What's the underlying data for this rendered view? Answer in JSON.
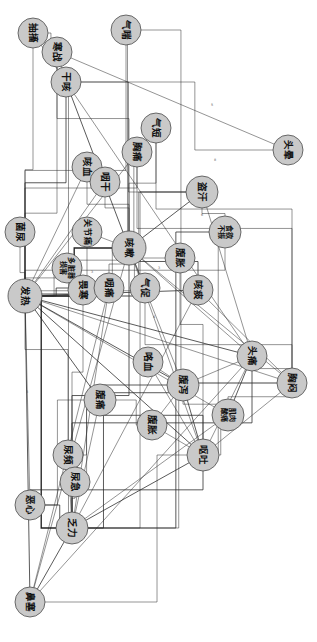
{
  "figure": {
    "type": "network-graph",
    "orientation_deg": 90,
    "node_count": 31,
    "background_color": "#ffffff",
    "node_fill_color": "#c9c9c9",
    "node_stroke_color": "#4a4a4a",
    "edge_color": "#2b2b2b"
  },
  "chart_data": {
    "type": "network",
    "layout": "force-directed",
    "nodes": [
      {
        "id": "chouchu",
        "label": "抽搐",
        "x": 33,
        "y": 33,
        "r": 15,
        "degree": 4
      },
      {
        "id": "hanzhan",
        "label": "寒战",
        "x": 57,
        "y": 52,
        "r": 15,
        "degree": 7
      },
      {
        "id": "gan_ke",
        "label": "干咳",
        "x": 66,
        "y": 82,
        "r": 15,
        "degree": 11
      },
      {
        "id": "qichuan",
        "label": "气喘",
        "x": 126,
        "y": 30,
        "r": 15,
        "degree": 6
      },
      {
        "id": "touyun",
        "label": "头晕",
        "x": 288,
        "y": 150,
        "r": 15,
        "degree": 9
      },
      {
        "id": "qiduan",
        "label": "气短",
        "x": 156,
        "y": 128,
        "r": 15,
        "degree": 8
      },
      {
        "id": "xiongtong",
        "label": "胸痛",
        "x": 137,
        "y": 152,
        "r": 15,
        "degree": 8
      },
      {
        "id": "kexue",
        "label": "咳血",
        "x": 87,
        "y": 167,
        "r": 15,
        "degree": 7
      },
      {
        "id": "yangan",
        "label": "咽干",
        "x": 105,
        "y": 182,
        "r": 15,
        "degree": 7
      },
      {
        "id": "daohan",
        "label": "盗汗",
        "x": 202,
        "y": 192,
        "r": 16,
        "degree": 12
      },
      {
        "id": "junniao",
        "label": "菌尿",
        "x": 20,
        "y": 232,
        "r": 15,
        "degree": 5
      },
      {
        "id": "guanjie",
        "label": "关节痛",
        "x": 87,
        "y": 232,
        "r": 15,
        "degree": 7
      },
      {
        "id": "shiyu",
        "label": "食欲不振",
        "x": 225,
        "y": 232,
        "r": 16,
        "degree": 11
      },
      {
        "id": "duozangqi",
        "label": "多脏器损害",
        "x": 67,
        "y": 268,
        "r": 15,
        "degree": 6
      },
      {
        "id": "kesou",
        "label": "咳嗽",
        "x": 129,
        "y": 248,
        "r": 17,
        "degree": 24
      },
      {
        "id": "fuxie_u",
        "label": "腹胀",
        "x": 180,
        "y": 258,
        "r": 15,
        "degree": 8
      },
      {
        "id": "fare",
        "label": "发热",
        "x": 25,
        "y": 296,
        "r": 17,
        "degree": 26
      },
      {
        "id": "quexie",
        "label": "畏寒",
        "x": 83,
        "y": 290,
        "r": 15,
        "degree": 8
      },
      {
        "id": "yantong",
        "label": "咽痛",
        "x": 109,
        "y": 288,
        "r": 15,
        "degree": 9
      },
      {
        "id": "qicu",
        "label": "气促",
        "x": 145,
        "y": 288,
        "r": 15,
        "degree": 9
      },
      {
        "id": "kuntan",
        "label": "咳痰",
        "x": 198,
        "y": 290,
        "r": 15,
        "degree": 10
      },
      {
        "id": "touteng",
        "label": "头痛",
        "x": 252,
        "y": 356,
        "r": 15,
        "degree": 13
      },
      {
        "id": "xiongmen",
        "label": "胸闷",
        "x": 292,
        "y": 383,
        "r": 15,
        "degree": 12
      },
      {
        "id": "kaxue",
        "label": "咯血",
        "x": 148,
        "y": 362,
        "r": 15,
        "degree": 8
      },
      {
        "id": "fuxie",
        "label": "腹泻",
        "x": 183,
        "y": 385,
        "r": 16,
        "degree": 14
      },
      {
        "id": "jirou",
        "label": "肌肉酸痛",
        "x": 228,
        "y": 415,
        "r": 16,
        "degree": 12
      },
      {
        "id": "futong",
        "label": "腹痛",
        "x": 100,
        "y": 400,
        "r": 16,
        "degree": 13
      },
      {
        "id": "fuzhang",
        "label": "腹胀",
        "x": 152,
        "y": 425,
        "r": 15,
        "degree": 9
      },
      {
        "id": "outu",
        "label": "呕吐",
        "x": 203,
        "y": 455,
        "r": 16,
        "degree": 13
      },
      {
        "id": "niaopin",
        "label": "尿频",
        "x": 68,
        "y": 455,
        "r": 15,
        "degree": 8
      },
      {
        "id": "niaoji",
        "label": "尿急",
        "x": 75,
        "y": 482,
        "r": 15,
        "degree": 7
      },
      {
        "id": "exin",
        "label": "恶心",
        "x": 30,
        "y": 505,
        "r": 15,
        "degree": 7
      },
      {
        "id": "fali",
        "label": "乏力",
        "x": 72,
        "y": 528,
        "r": 16,
        "degree": 15
      },
      {
        "id": "bise",
        "label": "鼻塞",
        "x": 30,
        "y": 602,
        "r": 15,
        "degree": 11
      }
    ],
    "edges": [
      {
        "source": "chouchu",
        "target": "hanzhan",
        "weight": 1
      },
      {
        "source": "chouchu",
        "target": "gan_ke",
        "weight": 1
      },
      {
        "source": "chouchu",
        "target": "fare",
        "weight": 2
      },
      {
        "source": "hanzhan",
        "target": "gan_ke",
        "weight": 1
      },
      {
        "source": "hanzhan",
        "target": "fare",
        "weight": 2
      },
      {
        "source": "hanzhan",
        "target": "kesou",
        "weight": 2
      },
      {
        "source": "hanzhan",
        "target": "touyun",
        "weight": 1
      },
      {
        "source": "gan_ke",
        "target": "kesou",
        "weight": 3
      },
      {
        "source": "gan_ke",
        "target": "fare",
        "weight": 3
      },
      {
        "source": "gan_ke",
        "target": "touyun",
        "weight": 1
      },
      {
        "source": "gan_ke",
        "target": "daohan",
        "weight": 1
      },
      {
        "source": "gan_ke",
        "target": "touteng",
        "weight": 1
      },
      {
        "source": "gan_ke",
        "target": "fali",
        "weight": 1
      },
      {
        "source": "qichuan",
        "target": "kesou",
        "weight": 2
      },
      {
        "source": "qichuan",
        "target": "fare",
        "weight": 1
      },
      {
        "source": "qichuan",
        "target": "xiongmen",
        "weight": 1
      },
      {
        "source": "qiduan",
        "target": "kesou",
        "weight": 2
      },
      {
        "source": "qiduan",
        "target": "xiongmen",
        "weight": 2
      },
      {
        "source": "qiduan",
        "target": "fare",
        "weight": 1
      },
      {
        "source": "xiongtong",
        "target": "kesou",
        "weight": 2
      },
      {
        "source": "xiongtong",
        "target": "fare",
        "weight": 1
      },
      {
        "source": "xiongtong",
        "target": "xiongmen",
        "weight": 1
      },
      {
        "source": "kexue",
        "target": "kesou",
        "weight": 2
      },
      {
        "source": "kexue",
        "target": "yangan",
        "weight": 1
      },
      {
        "source": "kexue",
        "target": "fare",
        "weight": 1
      },
      {
        "source": "yangan",
        "target": "kesou",
        "weight": 2
      },
      {
        "source": "yangan",
        "target": "fare",
        "weight": 1
      },
      {
        "source": "daohan",
        "target": "kesou",
        "weight": 3
      },
      {
        "source": "daohan",
        "target": "shiyu",
        "weight": 2
      },
      {
        "source": "daohan",
        "target": "fali",
        "weight": 2
      },
      {
        "source": "daohan",
        "target": "fare",
        "weight": 2
      },
      {
        "source": "daohan",
        "target": "touteng",
        "weight": 1
      },
      {
        "source": "junniao",
        "target": "fare",
        "weight": 2
      },
      {
        "source": "guanjie",
        "target": "kesou",
        "weight": 2
      },
      {
        "source": "guanjie",
        "target": "fare",
        "weight": 2
      },
      {
        "source": "shiyu",
        "target": "fali",
        "weight": 3
      },
      {
        "source": "shiyu",
        "target": "outu",
        "weight": 2
      },
      {
        "source": "shiyu",
        "target": "fare",
        "weight": 2
      },
      {
        "source": "duozangqi",
        "target": "fare",
        "weight": 2
      },
      {
        "source": "duozangqi",
        "target": "kesou",
        "weight": 1
      },
      {
        "source": "kesou",
        "target": "fare",
        "weight": 5
      },
      {
        "source": "kesou",
        "target": "kuntan",
        "weight": 3
      },
      {
        "source": "kesou",
        "target": "qicu",
        "weight": 2
      },
      {
        "source": "kesou",
        "target": "yantong",
        "weight": 2
      },
      {
        "source": "kesou",
        "target": "quexie",
        "weight": 2
      },
      {
        "source": "kesou",
        "target": "touteng",
        "weight": 2
      },
      {
        "source": "kesou",
        "target": "fali",
        "weight": 3
      },
      {
        "source": "kesou",
        "target": "bise",
        "weight": 2
      },
      {
        "source": "kesou",
        "target": "xiongmen",
        "weight": 2
      },
      {
        "source": "kesou",
        "target": "fuxie",
        "weight": 1
      },
      {
        "source": "kesou",
        "target": "outu",
        "weight": 1
      },
      {
        "source": "fuxie_u",
        "target": "fare",
        "weight": 1
      },
      {
        "source": "fuxie_u",
        "target": "outu",
        "weight": 2
      },
      {
        "source": "fare",
        "target": "quexie",
        "weight": 3
      },
      {
        "source": "fare",
        "target": "yantong",
        "weight": 3
      },
      {
        "source": "fare",
        "target": "qicu",
        "weight": 2
      },
      {
        "source": "fare",
        "target": "kuntan",
        "weight": 3
      },
      {
        "source": "fare",
        "target": "touteng",
        "weight": 3
      },
      {
        "source": "fare",
        "target": "fuxie",
        "weight": 3
      },
      {
        "source": "fare",
        "target": "futong",
        "weight": 3
      },
      {
        "source": "fare",
        "target": "outu",
        "weight": 3
      },
      {
        "source": "fare",
        "target": "fali",
        "weight": 4
      },
      {
        "source": "fare",
        "target": "bise",
        "weight": 3
      },
      {
        "source": "fare",
        "target": "jirou",
        "weight": 2
      },
      {
        "source": "fare",
        "target": "xiongmen",
        "weight": 2
      },
      {
        "source": "fare",
        "target": "niaopin",
        "weight": 2
      },
      {
        "source": "fare",
        "target": "exin",
        "weight": 2
      },
      {
        "source": "quexie",
        "target": "fali",
        "weight": 2
      },
      {
        "source": "yantong",
        "target": "bise",
        "weight": 2
      },
      {
        "source": "yantong",
        "target": "fali",
        "weight": 2
      },
      {
        "source": "qicu",
        "target": "xiongmen",
        "weight": 2
      },
      {
        "source": "kuntan",
        "target": "xiongmen",
        "weight": 2
      },
      {
        "source": "kuntan",
        "target": "fali",
        "weight": 2
      },
      {
        "source": "touteng",
        "target": "jirou",
        "weight": 3
      },
      {
        "source": "touteng",
        "target": "xiongmen",
        "weight": 2
      },
      {
        "source": "touteng",
        "target": "fuxie",
        "weight": 2
      },
      {
        "source": "touteng",
        "target": "fali",
        "weight": 3
      },
      {
        "source": "touteng",
        "target": "outu",
        "weight": 2
      },
      {
        "source": "touteng",
        "target": "bise",
        "weight": 2
      },
      {
        "source": "xiongmen",
        "target": "fali",
        "weight": 2
      },
      {
        "source": "xiongmen",
        "target": "jirou",
        "weight": 2
      },
      {
        "source": "xiongmen",
        "target": "outu",
        "weight": 2
      },
      {
        "source": "kaxue",
        "target": "fuxie",
        "weight": 1
      },
      {
        "source": "kaxue",
        "target": "outu",
        "weight": 1
      },
      {
        "source": "fuxie",
        "target": "outu",
        "weight": 3
      },
      {
        "source": "fuxie",
        "target": "futong",
        "weight": 3
      },
      {
        "source": "fuxie",
        "target": "fuzhang",
        "weight": 2
      },
      {
        "source": "fuxie",
        "target": "jirou",
        "weight": 2
      },
      {
        "source": "fuxie",
        "target": "fali",
        "weight": 3
      },
      {
        "source": "jirou",
        "target": "outu",
        "weight": 2
      },
      {
        "source": "jirou",
        "target": "fali",
        "weight": 2
      },
      {
        "source": "futong",
        "target": "outu",
        "weight": 3
      },
      {
        "source": "futong",
        "target": "fuzhang",
        "weight": 2
      },
      {
        "source": "futong",
        "target": "niaopin",
        "weight": 2
      },
      {
        "source": "futong",
        "target": "niaoji",
        "weight": 2
      },
      {
        "source": "futong",
        "target": "exin",
        "weight": 2
      },
      {
        "source": "futong",
        "target": "fali",
        "weight": 2
      },
      {
        "source": "fuzhang",
        "target": "outu",
        "weight": 2
      },
      {
        "source": "outu",
        "target": "exin",
        "weight": 3
      },
      {
        "source": "outu",
        "target": "fali",
        "weight": 3
      },
      {
        "source": "outu",
        "target": "bise",
        "weight": 2
      },
      {
        "source": "niaopin",
        "target": "niaoji",
        "weight": 3
      },
      {
        "source": "niaopin",
        "target": "fali",
        "weight": 2
      },
      {
        "source": "niaoji",
        "target": "fali",
        "weight": 2
      },
      {
        "source": "exin",
        "target": "fali",
        "weight": 3
      },
      {
        "source": "fali",
        "target": "bise",
        "weight": 3
      }
    ],
    "edge_labels": [
      {
        "x": 215,
        "y": 160,
        "text": "8"
      },
      {
        "x": 202,
        "y": 215,
        "text": "6"
      },
      {
        "x": 159,
        "y": 268,
        "text": "3"
      },
      {
        "x": 92,
        "y": 272,
        "text": "3"
      },
      {
        "x": 88,
        "y": 281,
        "text": "3"
      },
      {
        "x": 212,
        "y": 105,
        "text": "5"
      },
      {
        "x": 154,
        "y": 317,
        "text": "4"
      },
      {
        "x": 27,
        "y": 392,
        "text": "3"
      }
    ]
  }
}
